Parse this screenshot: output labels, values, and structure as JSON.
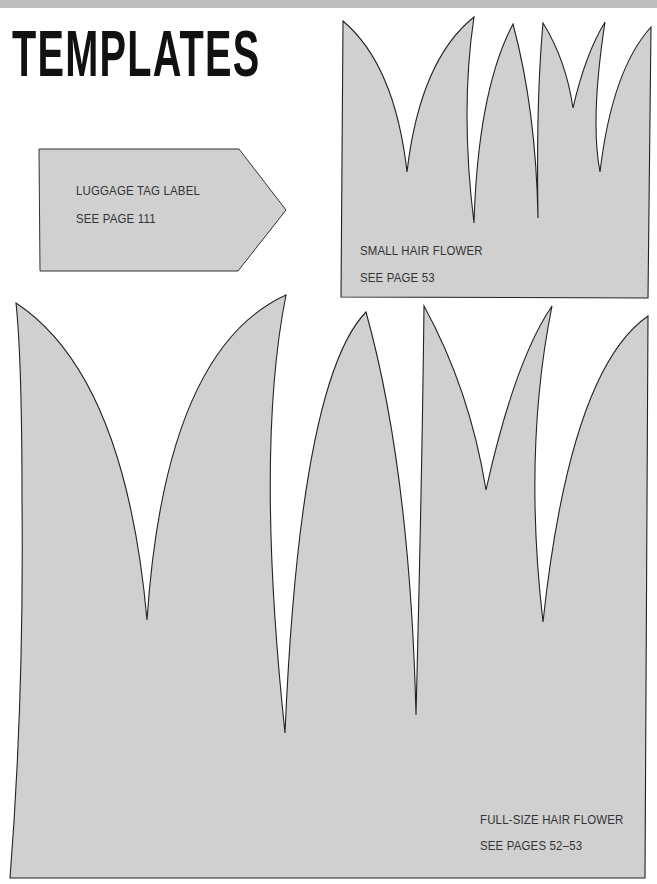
{
  "page": {
    "title": "TEMPLATES"
  },
  "colors": {
    "template_fill": "#d0d0d0",
    "outline": "#222222",
    "title": "#111111",
    "label_text": "#333333"
  },
  "templates": [
    {
      "id": "luggage-tag",
      "name": "LUGGAGE TAG LABEL",
      "reference": "SEE PAGE 111"
    },
    {
      "id": "small-hair-flower",
      "name": "SMALL HAIR FLOWER",
      "reference": "SEE PAGE 53"
    },
    {
      "id": "full-size-hair-flower",
      "name": "FULL-SIZE HAIR FLOWER",
      "reference": "SEE PAGES 52–53"
    }
  ]
}
